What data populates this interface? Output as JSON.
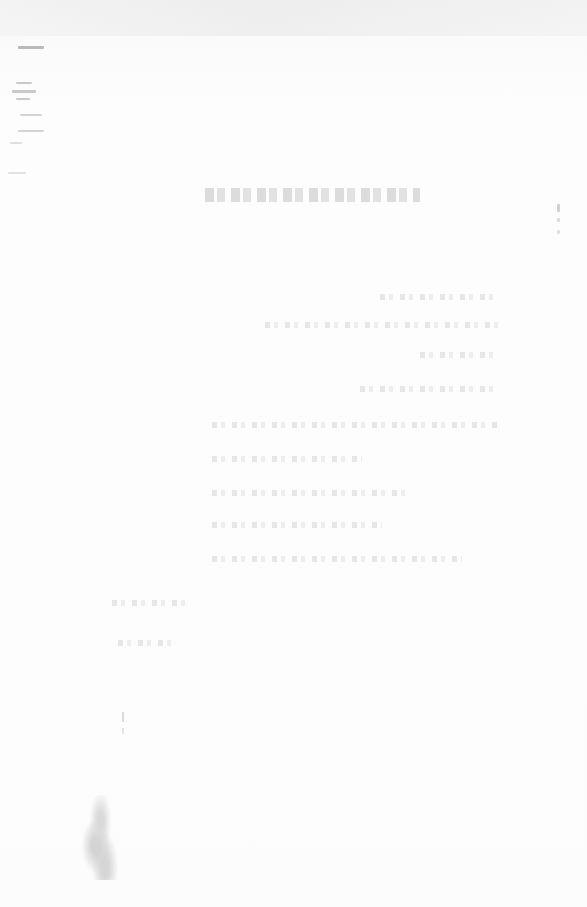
{
  "document": {
    "title": "",
    "legibility": "illegible",
    "body_lines": [
      "",
      "",
      "",
      "",
      "",
      "",
      "",
      "",
      "",
      "",
      ""
    ],
    "margin_note": "",
    "footer_lines": [
      "",
      ""
    ]
  }
}
